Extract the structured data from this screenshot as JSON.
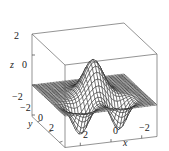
{
  "chart_data": {
    "type": "surface3d",
    "title": "",
    "xlabel": "x",
    "ylabel": "y",
    "zlabel": "z",
    "x_range": [
      -3,
      3
    ],
    "y_range": [
      -3,
      3
    ],
    "z_range": [
      -3,
      3
    ],
    "x_ticks": [
      "2",
      "0",
      "-2"
    ],
    "y_ticks": [
      "-2",
      "0",
      "2"
    ],
    "z_ticks": [
      "2",
      "0",
      "-2"
    ],
    "surface": "wireframe mesh: central peak z≈2.2 near (0,0), two troughs z≈-1.8 toward front (y>0) at x≈±1.5, flat z≈0 elsewhere",
    "grid": false,
    "box": true
  },
  "labels": {
    "z_axis": "z",
    "y_axis": "y",
    "x_axis": "x",
    "z_tick_2": "2",
    "z_tick_0": "0",
    "z_tick_m2": "−2",
    "y_tick_m2": "−2",
    "y_tick_0": "0",
    "y_tick_2": "2",
    "x_tick_2": "2",
    "x_tick_0": "0",
    "x_tick_m2": "−2"
  },
  "colors": {
    "mesh": "#1a1a1a",
    "box": "#555555",
    "face": "#ffffff"
  }
}
